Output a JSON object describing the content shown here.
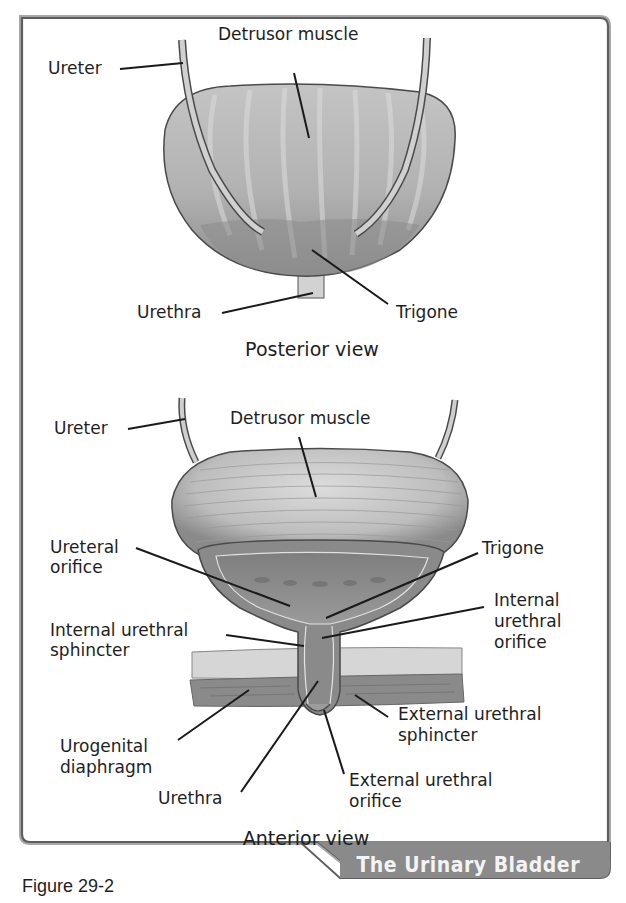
{
  "figure": {
    "number_label": "Figure 29-2",
    "tab_title": "The Urinary Bladder",
    "colors": {
      "frame": "#6e6e6e",
      "frame_shadow": "#a8a8a8",
      "tab_fill": "#8a8a8a",
      "tab_text": "#f4f4f4",
      "tissue_light": "#c9c9c9",
      "tissue_mid": "#9c9c9c",
      "tissue_dark": "#6a6a6a",
      "text": "#1e1e1e"
    }
  },
  "posterior": {
    "caption": "Posterior view",
    "labels": {
      "ureter": "Ureter",
      "detrusor": "Detrusor muscle",
      "urethra": "Urethra",
      "trigone": "Trigone"
    }
  },
  "anterior": {
    "caption": "Anterior view",
    "labels": {
      "ureter": "Ureter",
      "detrusor": "Detrusor muscle",
      "ureteral_orifice_1": "Ureteral",
      "ureteral_orifice_2": "orifice",
      "trigone": "Trigone",
      "internal_sphincter_1": "Internal urethral",
      "internal_sphincter_2": "sphincter",
      "internal_orifice_1": "Internal",
      "internal_orifice_2": "urethral",
      "internal_orifice_3": "orifice",
      "urogenital_1": "Urogenital",
      "urogenital_2": "diaphragm",
      "external_sphincter_1": "External urethral",
      "external_sphincter_2": "sphincter",
      "urethra": "Urethra",
      "external_orifice_1": "External urethral",
      "external_orifice_2": "orifice"
    }
  }
}
